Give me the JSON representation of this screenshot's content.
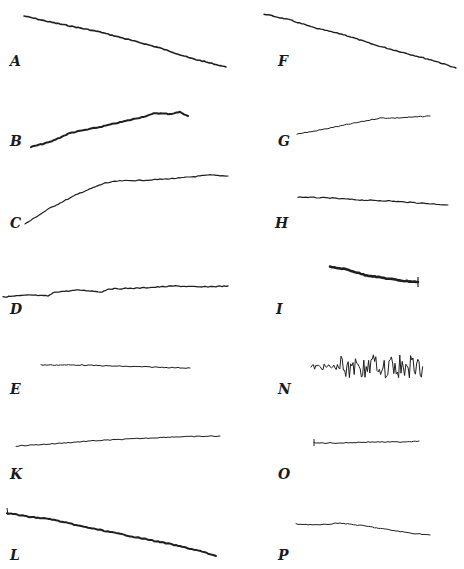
{
  "figure": {
    "panels": [
      {
        "id": "A",
        "label": "A",
        "label_pos": [
          10,
          66
        ],
        "stroke": 1.6,
        "points": [
          [
            24,
            16
          ],
          [
            50,
            22
          ],
          [
            70,
            26
          ],
          [
            100,
            32
          ],
          [
            130,
            40
          ],
          [
            160,
            48
          ],
          [
            190,
            58
          ],
          [
            226,
            67
          ]
        ]
      },
      {
        "id": "F",
        "label": "F",
        "label_pos": [
          278,
          66
        ],
        "stroke": 1.4,
        "points": [
          [
            264,
            14
          ],
          [
            290,
            20
          ],
          [
            315,
            28
          ],
          [
            345,
            35
          ],
          [
            375,
            45
          ],
          [
            405,
            53
          ],
          [
            435,
            61
          ],
          [
            456,
            68
          ]
        ]
      },
      {
        "id": "B",
        "label": "B",
        "label_pos": [
          10,
          146
        ],
        "stroke": 2.0,
        "points": [
          [
            31,
            147
          ],
          [
            50,
            142
          ],
          [
            70,
            133
          ],
          [
            100,
            127
          ],
          [
            130,
            120
          ],
          [
            150,
            115
          ],
          [
            155,
            113
          ],
          [
            170,
            114
          ],
          [
            180,
            112
          ],
          [
            188,
            116
          ]
        ]
      },
      {
        "id": "C",
        "label": "C",
        "label_pos": [
          10,
          228
        ],
        "stroke": 1.2,
        "points": [
          [
            25,
            224
          ],
          [
            50,
            208
          ],
          [
            80,
            193
          ],
          [
            105,
            183
          ],
          [
            118,
            181
          ],
          [
            150,
            180
          ],
          [
            180,
            178
          ],
          [
            210,
            175
          ],
          [
            228,
            176
          ]
        ]
      },
      {
        "id": "G",
        "label": "G",
        "label_pos": [
          278,
          146
        ],
        "stroke": 1.0,
        "points": [
          [
            297,
            134
          ],
          [
            315,
            131
          ],
          [
            335,
            127
          ],
          [
            360,
            122
          ],
          [
            380,
            118
          ],
          [
            395,
            118
          ],
          [
            415,
            117
          ],
          [
            430,
            116
          ]
        ]
      },
      {
        "id": "H",
        "label": "H",
        "label_pos": [
          275,
          228
        ],
        "stroke": 1.2,
        "points": [
          [
            298,
            197
          ],
          [
            330,
            198
          ],
          [
            360,
            200
          ],
          [
            390,
            201
          ],
          [
            420,
            203
          ],
          [
            448,
            205
          ]
        ]
      },
      {
        "id": "D",
        "label": "D",
        "label_pos": [
          10,
          314
        ],
        "stroke": 1.3,
        "points": [
          [
            3,
            297
          ],
          [
            30,
            295
          ],
          [
            48,
            296
          ],
          [
            55,
            292
          ],
          [
            80,
            290
          ],
          [
            102,
            292
          ],
          [
            108,
            289
          ],
          [
            140,
            288
          ],
          [
            175,
            286
          ],
          [
            200,
            287
          ],
          [
            228,
            286
          ]
        ]
      },
      {
        "id": "I",
        "label": "I",
        "label_pos": [
          276,
          314
        ],
        "stroke": 2.6,
        "points": [
          [
            330,
            267
          ],
          [
            345,
            269
          ],
          [
            365,
            275
          ],
          [
            390,
            279
          ],
          [
            405,
            281
          ],
          [
            418,
            282
          ]
        ]
      },
      {
        "id": "E",
        "label": "E",
        "label_pos": [
          10,
          394
        ],
        "stroke": 1.0,
        "points": [
          [
            41,
            365
          ],
          [
            80,
            365
          ],
          [
            110,
            366
          ],
          [
            150,
            367
          ],
          [
            190,
            368
          ]
        ]
      },
      {
        "id": "N",
        "label": "N",
        "label_pos": [
          278,
          394
        ],
        "stroke": 1.0,
        "type": "noisy",
        "x_range": [
          311,
          423
        ],
        "baseline": 367,
        "amplitude": 10
      },
      {
        "id": "K",
        "label": "K",
        "label_pos": [
          10,
          479
        ],
        "stroke": 1.0,
        "points": [
          [
            16,
            446
          ],
          [
            50,
            444
          ],
          [
            90,
            441
          ],
          [
            130,
            439
          ],
          [
            170,
            437
          ],
          [
            220,
            436
          ]
        ]
      },
      {
        "id": "O",
        "label": "O",
        "label_pos": [
          278,
          479
        ],
        "stroke": 1.0,
        "points": [
          [
            314,
            443
          ],
          [
            340,
            443
          ],
          [
            370,
            442
          ],
          [
            400,
            442
          ],
          [
            419,
            441
          ]
        ]
      },
      {
        "id": "L",
        "label": "L",
        "label_pos": [
          10,
          560
        ],
        "stroke": 2.0,
        "points": [
          [
            7,
            513
          ],
          [
            30,
            517
          ],
          [
            50,
            519
          ],
          [
            80,
            526
          ],
          [
            110,
            532
          ],
          [
            140,
            538
          ],
          [
            170,
            544
          ],
          [
            200,
            551
          ],
          [
            216,
            556
          ]
        ]
      },
      {
        "id": "P",
        "label": "P",
        "label_pos": [
          278,
          560
        ],
        "stroke": 1.0,
        "points": [
          [
            296,
            524
          ],
          [
            320,
            525
          ],
          [
            340,
            523
          ],
          [
            365,
            526
          ],
          [
            390,
            530
          ],
          [
            410,
            533
          ],
          [
            430,
            535
          ]
        ]
      }
    ]
  }
}
